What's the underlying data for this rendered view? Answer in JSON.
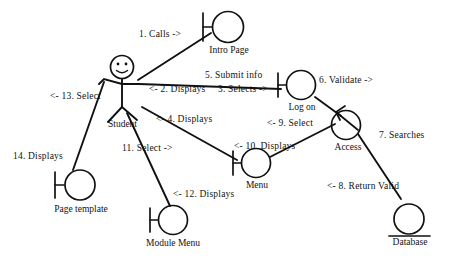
{
  "diagram": {
    "type": "robustness-collaboration-diagram",
    "stroke_color": "#111111",
    "background_color": "#ffffff"
  },
  "nodes": {
    "actor": {
      "label": "Student",
      "kind": "actor",
      "x": 122,
      "y": 67
    },
    "intro_page": {
      "label": "Intro Page",
      "kind": "boundary",
      "x": 228,
      "y": 27
    },
    "log_on": {
      "label": "Log on",
      "kind": "boundary",
      "x": 301,
      "y": 85
    },
    "access": {
      "label": "Access",
      "kind": "control",
      "x": 346,
      "y": 125
    },
    "database": {
      "label": "Database",
      "kind": "entity",
      "x": 409,
      "y": 219
    },
    "menu": {
      "label": "Menu",
      "kind": "boundary",
      "x": 256,
      "y": 163
    },
    "module_menu": {
      "label": "Module Menu",
      "kind": "boundary",
      "x": 173,
      "y": 220
    },
    "page_template": {
      "label": "Page template",
      "kind": "boundary",
      "x": 80,
      "y": 185
    }
  },
  "messages": [
    {
      "id": "m1",
      "text": "1. Calls ->",
      "x": 139,
      "y": 30
    },
    {
      "id": "m2",
      "text": "<- 2. Displays",
      "x": 149,
      "y": 85
    },
    {
      "id": "m3",
      "text": "3. Selects ->",
      "x": 218,
      "y": 85
    },
    {
      "id": "m4",
      "text": "<- 4. Displays",
      "x": 156,
      "y": 115
    },
    {
      "id": "m5",
      "text": "5. Submit  info",
      "x": 205,
      "y": 71
    },
    {
      "id": "m6",
      "text": "6. Validate ->",
      "x": 319,
      "y": 76
    },
    {
      "id": "m7",
      "text": "7. Searches",
      "x": 379,
      "y": 131
    },
    {
      "id": "m8",
      "text": "<- 8. Return Valid",
      "x": 327,
      "y": 182
    },
    {
      "id": "m9",
      "text": "<- 9. Select",
      "x": 267,
      "y": 119
    },
    {
      "id": "m10",
      "text": "<- 10. Displays",
      "x": 234,
      "y": 142
    },
    {
      "id": "m11",
      "text": "11. Select ->",
      "x": 122,
      "y": 144
    },
    {
      "id": "m12",
      "text": "<- 12. Displays",
      "x": 173,
      "y": 190
    },
    {
      "id": "m13",
      "text": "<- 13. Select",
      "x": 50,
      "y": 92
    },
    {
      "id": "m14",
      "text": "14.  Displays",
      "x": 13,
      "y": 152
    }
  ]
}
